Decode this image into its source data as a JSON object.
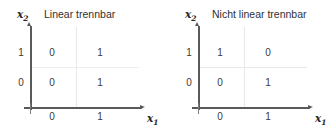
{
  "figure": {
    "background_color": "#ffffff",
    "axis_color": "#595959",
    "grid_color": "#e9e9e9",
    "text_color": "#3a3a3a"
  },
  "axis_labels": {
    "x_name": "x",
    "x_sub": "1",
    "y_name": "x",
    "y_sub": "2"
  },
  "ticks": {
    "x": [
      "0",
      "1"
    ],
    "y": [
      "0",
      "1"
    ]
  },
  "panels": [
    {
      "id": "linear-separable",
      "title": "Linear trennbar",
      "cells": {
        "x0_y1": "0",
        "x1_y1": "1",
        "x0_y0": "0",
        "x1_y0": "1"
      }
    },
    {
      "id": "not-linear-separable",
      "title": "Nicht linear trennbar",
      "cells": {
        "x0_y1": "1",
        "x1_y1": "0",
        "x0_y0": "0",
        "x1_y0": "1"
      }
    }
  ],
  "chart_data": {
    "type": "table",
    "xlabel": "x1",
    "ylabel": "x2",
    "xlim": [
      0,
      1
    ],
    "ylim": [
      0,
      1
    ],
    "grid": true,
    "legend_position": "none",
    "subplots": [
      {
        "title": "Linear trennbar",
        "x_tick_labels": [
          "0",
          "1"
        ],
        "y_tick_labels": [
          "0",
          "1"
        ],
        "points": [
          {
            "x1": 0,
            "x2": 0,
            "label": 0
          },
          {
            "x1": 1,
            "x2": 0,
            "label": 1
          },
          {
            "x1": 0,
            "x2": 1,
            "label": 0
          },
          {
            "x1": 1,
            "x2": 1,
            "label": 1
          }
        ]
      },
      {
        "title": "Nicht linear trennbar",
        "x_tick_labels": [
          "0",
          "1"
        ],
        "y_tick_labels": [
          "0",
          "1"
        ],
        "points": [
          {
            "x1": 0,
            "x2": 0,
            "label": 0
          },
          {
            "x1": 1,
            "x2": 0,
            "label": 1
          },
          {
            "x1": 0,
            "x2": 1,
            "label": 1
          },
          {
            "x1": 1,
            "x2": 1,
            "label": 0
          }
        ]
      }
    ]
  }
}
